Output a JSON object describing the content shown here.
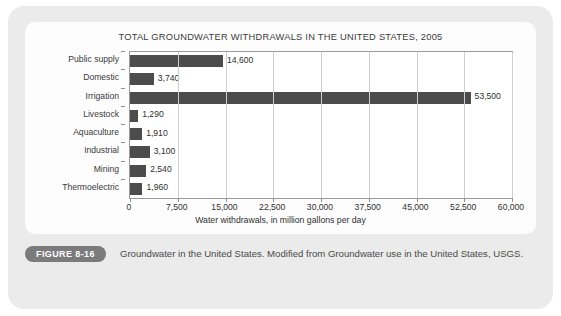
{
  "figure": {
    "badge_label": "FIGURE 8-16",
    "caption": "Groundwater in the United States. Modified from Groundwater use in the United States, USGS."
  },
  "colors": {
    "bar": "#4c4c4c",
    "card_background": "#ebebeb",
    "panel_background": "#fdfdfd",
    "gridline": "#cfcfcf",
    "axis": "#9a9a9a",
    "badge": "#7b7b7b"
  },
  "chart_data": {
    "type": "bar",
    "orientation": "horizontal",
    "title": "TOTAL GROUNDWATER WITHDRAWALS IN THE UNITED STATES, 2005",
    "xlabel": "Water withdrawals, in million gallons per day",
    "ylabel": "",
    "categories": [
      "Public supply",
      "Domestic",
      "Irrigation",
      "Livestock",
      "Aquaculture",
      "Industrial",
      "Mining",
      "Thermoelectric"
    ],
    "values": [
      14600,
      3740,
      53500,
      1290,
      1910,
      3100,
      2540,
      1960
    ],
    "value_labels": [
      "14,600",
      "3,740",
      "53,500",
      "1,290",
      "1,910",
      "3,100",
      "2,540",
      "1,960"
    ],
    "xlim": [
      0,
      60000
    ],
    "xticks": [
      0,
      7500,
      15000,
      22500,
      30000,
      37500,
      45000,
      52500,
      60000
    ],
    "xtick_labels": [
      "0",
      "7,500",
      "15,000",
      "22,500",
      "30,000",
      "37,500",
      "45,000",
      "52,500",
      "60,000"
    ],
    "grid": "vertical",
    "legend": "none",
    "series_name": "Water withdrawals"
  }
}
